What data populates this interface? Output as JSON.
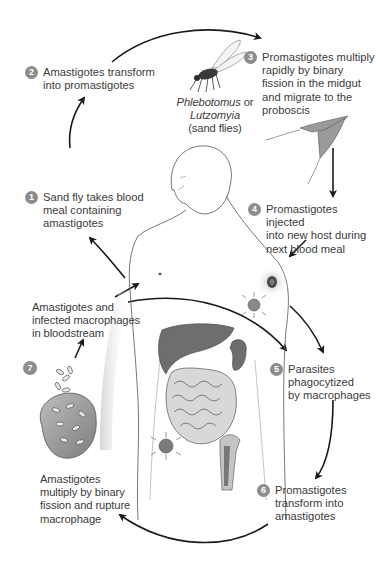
{
  "diagram": {
    "type": "life-cycle",
    "colors": {
      "arrow": "#1a1a1a",
      "step_badge": "#8c8c8c",
      "text": "#3b3b3b",
      "organ": "#6e6e6e",
      "outline": "#555555"
    },
    "vector_label": {
      "genus1": "Phlebotomus",
      "or": " or",
      "genus2": "Lutzomyia",
      "common": "(sand flies)"
    },
    "steps": [
      {
        "number": "1",
        "lines": [
          "Sand fly takes blood",
          "meal containing",
          "amastigotes"
        ]
      },
      {
        "number": "2",
        "lines": [
          "Amastigotes transform",
          "into promastigotes"
        ]
      },
      {
        "number": "3",
        "lines": [
          "Promastigotes multiply",
          "rapidly by binary",
          "fission in the midgut",
          "and migrate to the",
          "proboscis"
        ]
      },
      {
        "number": "4",
        "lines": [
          "Promastigotes injected",
          "into new host during",
          "next blood meal"
        ]
      },
      {
        "number": "5",
        "lines": [
          "Parasites",
          "phagocytized",
          "by macrophages"
        ]
      },
      {
        "number": "6",
        "lines": [
          "Promastigotes",
          "transform into",
          "amastigotes"
        ]
      },
      {
        "number": "7",
        "lines": []
      }
    ],
    "annotations": {
      "bloodstream": [
        "Amastigotes and",
        "infected macrophages",
        "in bloodstream"
      ],
      "rupture": [
        "Amastigotes",
        "multiply by binary",
        "fission and rupture",
        "macrophage"
      ]
    },
    "icons": [
      "sand-fly-icon",
      "promastigote-icon",
      "human-figure-icon",
      "liver-icon",
      "spleen-icon",
      "intestine-icon",
      "bone-icon",
      "macrophage-icon",
      "skin-lesion-icon"
    ]
  }
}
